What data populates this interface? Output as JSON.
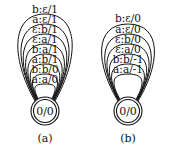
{
  "diagrams": [
    {
      "caption": "(a)",
      "state_label": "0/0",
      "loops": [
        "b:ε/1",
        "a:ε/1",
        "ε:b/1",
        "ε:a/1",
        "b:a/1",
        "a:b/1",
        "b:b/0",
        "a:a/0"
      ]
    },
    {
      "caption": "(b)",
      "state_label": "0/0",
      "loops": [
        "b:ε/0",
        "a:ε/0",
        "ε:b/0",
        "ε:a/0",
        "b:b/-1",
        "a:a/-1"
      ]
    }
  ]
}
